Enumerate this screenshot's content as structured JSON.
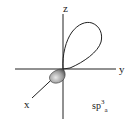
{
  "diagram": {
    "axes": {
      "z_label": "z",
      "y_label": "y",
      "x_label": "x"
    },
    "orbital_label": {
      "base": "sp",
      "superscript": "3",
      "subscript": "a"
    },
    "colors": {
      "line": "#222222",
      "small_lobe_fill": "#9a9a9a",
      "background": "#ffffff"
    }
  }
}
